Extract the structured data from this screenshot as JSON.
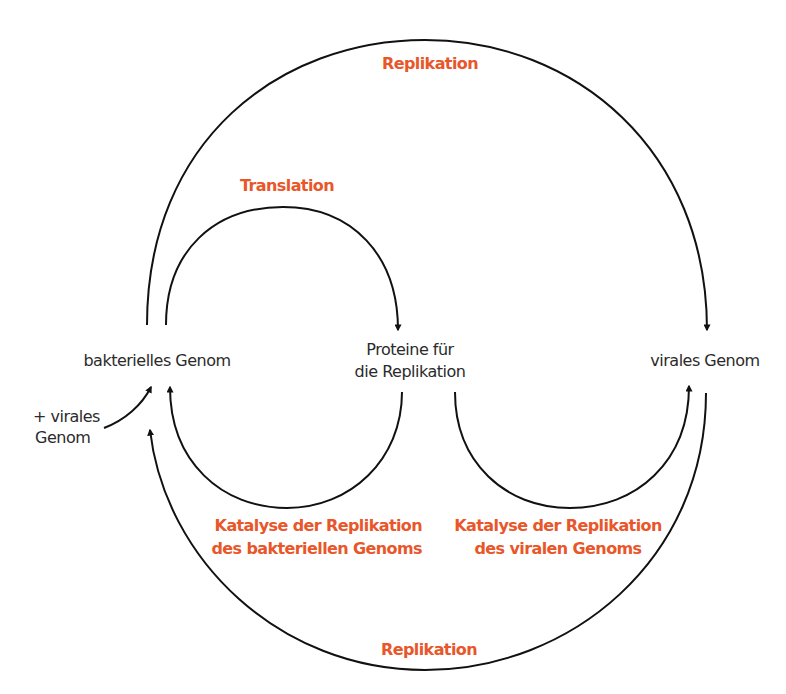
{
  "nodes": {
    "bacterial_genome": "bakterielles Genom",
    "proteins_line1": "Proteine für",
    "proteins_line2": "die Replikation",
    "viral_genome": "virales Genom",
    "input_line1": "+ virales",
    "input_line2": "Genom"
  },
  "processes": {
    "replication_top": "Replikation",
    "translation": "Translation",
    "catalysis_bacterial_line1": "Katalyse der Replikation",
    "catalysis_bacterial_line2": "des bakteriellen Genoms",
    "catalysis_viral_line1": "Katalyse der Replikation",
    "catalysis_viral_line2": "des viralen Genoms",
    "replication_bottom": "Replikation"
  },
  "colors": {
    "process_label": "#e8562a",
    "node_label": "#2b2b2b",
    "arrow": "#111111"
  },
  "edges": [
    {
      "from": "bakterielles Genom",
      "to": "virales Genom",
      "label": "Replikation"
    },
    {
      "from": "bakterielles Genom",
      "to": "Proteine für die Replikation",
      "label": "Translation"
    },
    {
      "from": "Proteine für die Replikation",
      "to": "bakterielles Genom",
      "label": "Katalyse der Replikation des bakteriellen Genoms"
    },
    {
      "from": "Proteine für die Replikation",
      "to": "virales Genom",
      "label": "Katalyse der Replikation des viralen Genoms"
    },
    {
      "from": "virales Genom",
      "to": "bakterielles Genom",
      "label": "Replikation"
    },
    {
      "from": "+ virales Genom",
      "to": "bakterielles Genom",
      "label": ""
    }
  ]
}
